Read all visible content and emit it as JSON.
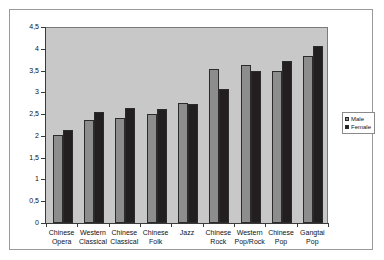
{
  "chart_data": {
    "type": "bar",
    "title": "",
    "subtitle": "",
    "xlabel": "",
    "ylabel": "",
    "categories": [
      "Chinese Opera",
      "Western Classical",
      "Chinese Classical",
      "Chinese Folk",
      "Jazz",
      "Chinese Rock",
      "Western Pop/Rock",
      "Chinese Pop",
      "Gangtai Pop"
    ],
    "category_lines": [
      [
        "Chinese",
        "Opera"
      ],
      [
        "Western",
        "Classical"
      ],
      [
        "Chinese",
        "Classical"
      ],
      [
        "Chinese",
        "Folk"
      ],
      [
        "Jazz",
        ""
      ],
      [
        "Chinese",
        "Rock"
      ],
      [
        "Western",
        "Pop/Rock"
      ],
      [
        "Chinese",
        "Pop"
      ],
      [
        "Gangtai",
        "Pop"
      ]
    ],
    "series": [
      {
        "name": "Male",
        "color": "#8d8d8d",
        "values": [
          2.03,
          2.37,
          2.41,
          2.51,
          2.76,
          3.53,
          3.63,
          3.49,
          3.83
        ]
      },
      {
        "name": "Female",
        "color": "#231f20",
        "values": [
          2.14,
          2.56,
          2.64,
          2.61,
          2.73,
          3.08,
          3.48,
          3.72,
          4.07
        ]
      }
    ],
    "ylim": [
      0,
      4.5
    ],
    "ytick_values": [
      0,
      0.5,
      1,
      1.5,
      2,
      2.5,
      3,
      3.5,
      4,
      4.5
    ],
    "ytick_labels": [
      "0",
      "0,5",
      "1",
      "1,5",
      "2",
      "2,5",
      "3",
      "3,5",
      "4",
      "4,5"
    ],
    "grid": false,
    "legend_position": "right",
    "plot_background": "#c8c8c8",
    "figure_background": "#ffffff",
    "border_color": "#9a9a9a"
  },
  "legend": {
    "entries": [
      {
        "label": "Male",
        "marker": "square-gray-swatch"
      },
      {
        "label": "Female",
        "marker": "square-black-swatch"
      }
    ]
  }
}
